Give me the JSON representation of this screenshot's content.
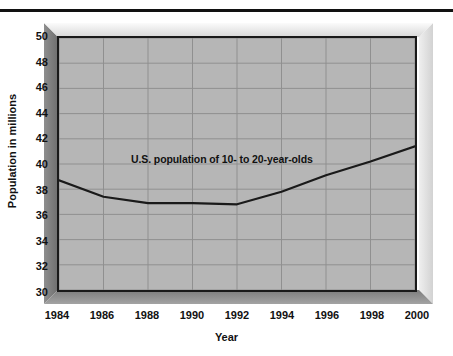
{
  "figure": {
    "top_rule": "",
    "frame_style": "3d-beveled",
    "plot_background_color": "#b6b6b6",
    "line_color": "#1a1a1a",
    "grid_color": "#8f8f8f"
  },
  "chart_data": {
    "type": "line",
    "title": "",
    "annotation": "U.S. population of 10- to 20-year-olds",
    "xlabel": "Year",
    "ylabel": "Population in millions",
    "xlim": [
      1984,
      2000
    ],
    "ylim": [
      30,
      50
    ],
    "ytick_step": 2,
    "xtick_step": 2,
    "grid": true,
    "legend": "none",
    "xticks": [
      "1984",
      "1986",
      "1988",
      "1990",
      "1992",
      "1994",
      "1996",
      "1998",
      "2000"
    ],
    "yticks": [
      "30",
      "32",
      "34",
      "36",
      "38",
      "40",
      "42",
      "44",
      "46",
      "48",
      "50"
    ],
    "x": [
      1984,
      1986,
      1988,
      1990,
      1992,
      1994,
      1996,
      1998,
      2000
    ],
    "values": [
      38.7,
      37.4,
      36.9,
      36.9,
      36.8,
      37.8,
      39.1,
      40.2,
      41.4
    ],
    "series": [
      {
        "name": "U.S. population of 10- to 20-year-olds",
        "values": [
          38.7,
          37.4,
          36.9,
          36.9,
          36.8,
          37.8,
          39.1,
          40.2,
          41.4
        ]
      }
    ]
  }
}
